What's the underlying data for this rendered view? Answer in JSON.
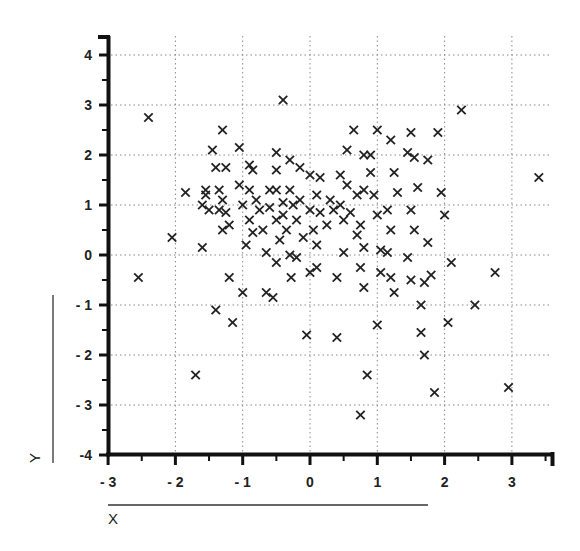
{
  "chart_data": {
    "type": "scatter",
    "title": "",
    "xlabel": "X",
    "ylabel": "Y",
    "xlim": [
      -3,
      3.6
    ],
    "ylim": [
      -4,
      4.3
    ],
    "grid": true,
    "grid_style": "dotted",
    "marker": "x",
    "x_ticks": [
      -3,
      -2,
      -1,
      0,
      1,
      2,
      3
    ],
    "x_tick_labels": [
      "- 3",
      "- 2",
      "- 1",
      "0",
      "1",
      "2",
      "3"
    ],
    "y_ticks": [
      4,
      3,
      2,
      1,
      0,
      -1,
      -2,
      -3,
      -4
    ],
    "y_tick_labels": [
      "4",
      "3",
      "2",
      "1",
      "0",
      "- 1",
      "- 2",
      "- 3",
      "-4"
    ],
    "points": [
      [
        -2.4,
        2.75
      ],
      [
        -2.55,
        -0.45
      ],
      [
        -2.05,
        0.35
      ],
      [
        -1.85,
        1.25
      ],
      [
        -1.7,
        -2.4
      ],
      [
        -1.6,
        1.0
      ],
      [
        -1.6,
        0.15
      ],
      [
        -1.55,
        1.3
      ],
      [
        -1.55,
        1.2
      ],
      [
        -1.5,
        0.9
      ],
      [
        -1.45,
        2.1
      ],
      [
        -1.4,
        1.75
      ],
      [
        -1.4,
        -1.1
      ],
      [
        -1.35,
        1.3
      ],
      [
        -1.35,
        0.9
      ],
      [
        -1.3,
        2.5
      ],
      [
        -1.3,
        1.1
      ],
      [
        -1.3,
        0.5
      ],
      [
        -1.25,
        1.75
      ],
      [
        -1.25,
        0.85
      ],
      [
        -1.2,
        0.6
      ],
      [
        -1.2,
        -0.45
      ],
      [
        -1.15,
        -1.35
      ],
      [
        -1.05,
        2.15
      ],
      [
        -1.05,
        1.4
      ],
      [
        -1.0,
        1.0
      ],
      [
        -1.0,
        -0.75
      ],
      [
        -0.95,
        0.2
      ],
      [
        -0.9,
        1.8
      ],
      [
        -0.9,
        1.3
      ],
      [
        -0.9,
        0.7
      ],
      [
        -0.85,
        1.7
      ],
      [
        -0.85,
        0.45
      ],
      [
        -0.8,
        1.1
      ],
      [
        -0.75,
        0.9
      ],
      [
        -0.7,
        0.5
      ],
      [
        -0.65,
        0.05
      ],
      [
        -0.65,
        -0.75
      ],
      [
        -0.6,
        1.3
      ],
      [
        -0.6,
        0.95
      ],
      [
        -0.55,
        -0.85
      ],
      [
        -0.5,
        2.05
      ],
      [
        -0.5,
        1.7
      ],
      [
        -0.5,
        1.3
      ],
      [
        -0.5,
        0.7
      ],
      [
        -0.5,
        -0.15
      ],
      [
        -0.45,
        0.3
      ],
      [
        -0.4,
        3.1
      ],
      [
        -0.4,
        1.05
      ],
      [
        -0.4,
        0.8
      ],
      [
        -0.35,
        0.5
      ],
      [
        -0.3,
        1.9
      ],
      [
        -0.3,
        1.3
      ],
      [
        -0.3,
        0.0
      ],
      [
        -0.28,
        -0.45
      ],
      [
        -0.25,
        1.0
      ],
      [
        -0.2,
        0.7
      ],
      [
        -0.2,
        -0.05
      ],
      [
        -0.15,
        1.75
      ],
      [
        -0.15,
        1.1
      ],
      [
        -0.1,
        0.35
      ],
      [
        -0.05,
        -1.6
      ],
      [
        0.0,
        1.6
      ],
      [
        0.0,
        0.9
      ],
      [
        0.0,
        -0.35
      ],
      [
        0.05,
        0.5
      ],
      [
        0.1,
        1.2
      ],
      [
        0.1,
        0.2
      ],
      [
        0.1,
        -0.25
      ],
      [
        0.15,
        1.55
      ],
      [
        0.15,
        0.85
      ],
      [
        0.25,
        0.6
      ],
      [
        0.3,
        1.1
      ],
      [
        0.35,
        0.9
      ],
      [
        0.4,
        -0.45
      ],
      [
        0.4,
        -1.65
      ],
      [
        0.45,
        1.6
      ],
      [
        0.45,
        1.0
      ],
      [
        0.5,
        0.05
      ],
      [
        0.5,
        0.7
      ],
      [
        0.55,
        2.1
      ],
      [
        0.55,
        1.4
      ],
      [
        0.6,
        0.85
      ],
      [
        0.65,
        2.5
      ],
      [
        0.7,
        1.2
      ],
      [
        0.7,
        0.4
      ],
      [
        0.75,
        0.6
      ],
      [
        0.75,
        -0.25
      ],
      [
        0.75,
        -3.2
      ],
      [
        0.8,
        2.0
      ],
      [
        0.8,
        1.3
      ],
      [
        0.8,
        0.15
      ],
      [
        0.8,
        -0.65
      ],
      [
        0.85,
        -2.4
      ],
      [
        0.9,
        2.0
      ],
      [
        0.9,
        1.65
      ],
      [
        0.95,
        1.2
      ],
      [
        1.0,
        2.5
      ],
      [
        1.0,
        0.8
      ],
      [
        1.0,
        -1.4
      ],
      [
        1.05,
        0.1
      ],
      [
        1.05,
        -0.35
      ],
      [
        1.15,
        0.9
      ],
      [
        1.15,
        0.05
      ],
      [
        1.2,
        2.3
      ],
      [
        1.2,
        0.5
      ],
      [
        1.2,
        -0.45
      ],
      [
        1.25,
        1.65
      ],
      [
        1.25,
        -0.75
      ],
      [
        1.3,
        1.25
      ],
      [
        1.45,
        2.05
      ],
      [
        1.45,
        -0.05
      ],
      [
        1.5,
        2.45
      ],
      [
        1.5,
        0.9
      ],
      [
        1.5,
        -0.5
      ],
      [
        1.55,
        1.95
      ],
      [
        1.55,
        0.5
      ],
      [
        1.6,
        1.35
      ],
      [
        1.65,
        -1.0
      ],
      [
        1.65,
        -1.55
      ],
      [
        1.7,
        -0.55
      ],
      [
        1.7,
        -2.0
      ],
      [
        1.75,
        1.9
      ],
      [
        1.75,
        0.25
      ],
      [
        1.8,
        -0.4
      ],
      [
        1.85,
        -2.75
      ],
      [
        1.9,
        2.45
      ],
      [
        1.95,
        1.25
      ],
      [
        2.0,
        0.8
      ],
      [
        2.05,
        -1.35
      ],
      [
        2.1,
        -0.15
      ],
      [
        2.25,
        2.9
      ],
      [
        2.45,
        -1.0
      ],
      [
        2.75,
        -0.35
      ],
      [
        2.95,
        -2.65
      ],
      [
        3.4,
        1.55
      ]
    ]
  },
  "labels": {
    "x_axis_title": "X",
    "y_axis_title": "Y"
  }
}
